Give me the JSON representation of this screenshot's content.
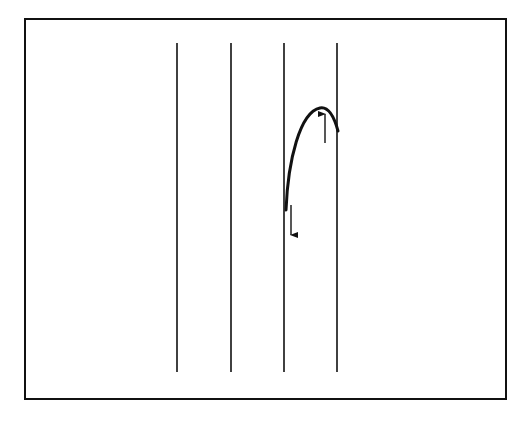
{
  "figure": {
    "width": 525,
    "height": 433,
    "background": "#ffffff",
    "stroke_color": "#111111",
    "frame": {
      "x": 25,
      "y": 19,
      "width": 481,
      "height": 380,
      "stroke_width": 2
    },
    "vertical_lines": [
      {
        "x": 177,
        "y1": 43,
        "y2": 372
      },
      {
        "x": 231,
        "y1": 43,
        "y2": 372
      },
      {
        "x": 284,
        "y1": 43,
        "y2": 372
      },
      {
        "x": 337,
        "y1": 43,
        "y2": 372
      }
    ],
    "curve": {
      "description": "arc rising from third line to a peak then descending to fourth line",
      "path": "M 286 210 C 288 160, 300 112, 320 108 C 330 106, 335 120, 338 131",
      "stroke_width": 3
    },
    "arrows": [
      {
        "name": "down-arrow",
        "x": 291,
        "y_start": 205,
        "y_end": 235,
        "direction": "down"
      },
      {
        "name": "up-arrow",
        "x": 325,
        "y_start": 143,
        "y_end": 114,
        "direction": "up"
      }
    ]
  }
}
